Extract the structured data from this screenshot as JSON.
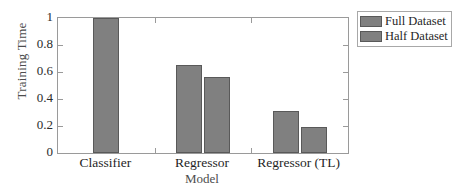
{
  "chart_data": {
    "type": "bar",
    "title": "",
    "subtitle": "",
    "xlabel": "Model",
    "ylabel": "Training Time",
    "categories": [
      "Classifier",
      "Regressor",
      "Regressor (TL)"
    ],
    "series": [
      {
        "name": "Full Dataset",
        "values": [
          1.0,
          0.65,
          0.31
        ],
        "color": "#808080"
      },
      {
        "name": "Half Dataset",
        "values": [
          null,
          0.56,
          0.19
        ],
        "color": "#808080"
      }
    ],
    "ylim": [
      0,
      1
    ],
    "yticks": [
      0,
      0.2,
      0.4,
      0.6,
      0.8,
      1
    ],
    "ytick_labels": [
      "0",
      "0.2",
      "0.4",
      "0.6",
      "0.8",
      "1"
    ],
    "grid": false,
    "legend_position": "outside-top-right",
    "bar_edge_color": "#595959",
    "axis_color": "#9a9a9a",
    "background": "#ffffff"
  },
  "legend": {
    "entries": [
      {
        "label": "Full Dataset"
      },
      {
        "label": "Half Dataset"
      }
    ]
  }
}
